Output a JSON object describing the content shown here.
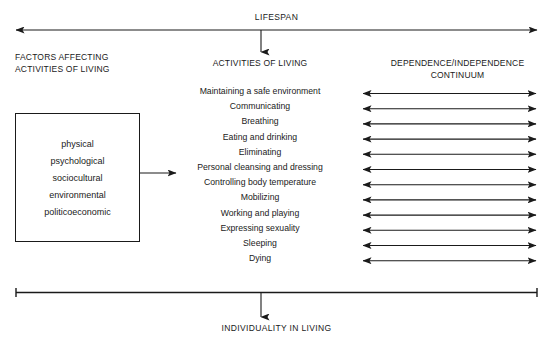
{
  "diagram": {
    "top_label": "LIFESPAN",
    "bottom_label": "INDIVIDUALITY IN LIVING",
    "columns": {
      "left_heading_line1": "FACTORS AFFECTING",
      "left_heading_line2": "ACTIVITIES OF LIVING",
      "middle_heading": "ACTIVITIES OF LIVING",
      "right_heading_line1": "DEPENDENCE/INDEPENDENCE",
      "right_heading_line2": "CONTINUUM"
    },
    "factors": [
      {
        "label": "physical"
      },
      {
        "label": "psychological"
      },
      {
        "label": "sociocultural"
      },
      {
        "label": "environmental"
      },
      {
        "label": "politicoeconomic"
      }
    ],
    "activities": [
      {
        "label": "Maintaining a safe environment"
      },
      {
        "label": "Communicating"
      },
      {
        "label": "Breathing"
      },
      {
        "label": "Eating and drinking"
      },
      {
        "label": "Eliminating"
      },
      {
        "label": "Personal cleansing and dressing"
      },
      {
        "label": "Controlling body temperature"
      },
      {
        "label": "Mobilizing"
      },
      {
        "label": "Working and playing"
      },
      {
        "label": "Expressing sexuality"
      },
      {
        "label": "Sleeping"
      },
      {
        "label": "Dying"
      }
    ],
    "colors": {
      "ink": "#1a1a1a",
      "background": "#ffffff"
    }
  }
}
